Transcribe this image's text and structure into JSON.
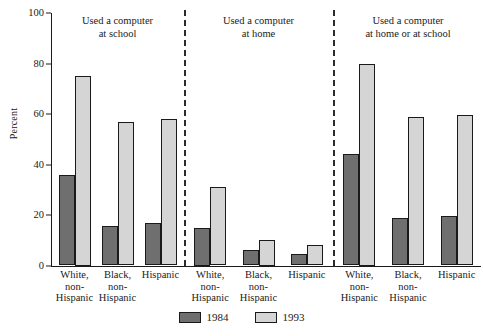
{
  "chart_data": {
    "type": "bar",
    "title": "",
    "xlabel": "",
    "ylabel": "Percent",
    "ylim": [
      0,
      100
    ],
    "yticks": [
      0,
      20,
      40,
      60,
      80,
      100
    ],
    "grid": false,
    "legend_position": "bottom-center",
    "categories": [
      "White,\nnon-\nHispanic",
      "Black,\nnon-\nHispanic",
      "Hispanic"
    ],
    "series": [
      {
        "name": "1984",
        "color": "#6f6f6f"
      },
      {
        "name": "1993",
        "color": "#d5d5d5"
      }
    ],
    "panels": [
      {
        "title": "Used a computer\nat school",
        "categories": [
          "White,\nnon-\nHispanic",
          "Black,\nnon-\nHispanic",
          "Hispanic"
        ],
        "series": [
          {
            "name": "1984",
            "values": [
              36,
              15.5,
              17
            ]
          },
          {
            "name": "1993",
            "values": [
              75,
              57,
              58
            ]
          }
        ]
      },
      {
        "title": "Used a computer\nat home",
        "categories": [
          "White,\nnon-\nHispanic",
          "Black,\nnon-\nHispanic",
          "Hispanic"
        ],
        "series": [
          {
            "name": "1984",
            "values": [
              15,
              6,
              4.5
            ]
          },
          {
            "name": "1993",
            "values": [
              31,
              10,
              8
            ]
          }
        ]
      },
      {
        "title": "Used a computer\nat home or at school",
        "categories": [
          "White,\nnon-\nHispanic",
          "Black,\nnon-\nHispanic",
          "Hispanic"
        ],
        "series": [
          {
            "name": "1984",
            "values": [
              44,
              19,
              19.5
            ]
          },
          {
            "name": "1993",
            "values": [
              80,
              59,
              59.5
            ]
          }
        ]
      }
    ]
  },
  "axis": {
    "y_title": "Percent",
    "y_tick_labels": [
      "100",
      "80",
      "60",
      "40",
      "20",
      "0"
    ]
  },
  "panels": [
    {
      "title": "Used a computer\nat school"
    },
    {
      "title": "Used a computer\nat home"
    },
    {
      "title": "Used a computer\nat home or at school"
    }
  ],
  "cat_labels": [
    "White,\nnon-\nHispanic",
    "Black,\nnon-\nHispanic",
    "Hispanic",
    "White,\nnon-\nHispanic",
    "Black,\nnon-\nHispanic",
    "Hispanic",
    "White,\nnon-\nHispanic",
    "Black,\nnon-\nHispanic",
    "Hispanic"
  ],
  "legend": {
    "items": [
      {
        "label": "1984",
        "color": "#6f6f6f"
      },
      {
        "label": "1993",
        "color": "#d5d5d5"
      }
    ]
  }
}
